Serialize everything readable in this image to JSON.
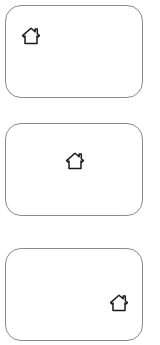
{
  "canvas": {
    "width": 160,
    "height": 345,
    "background_color": "#ffffff"
  },
  "style": {
    "panel_border_color": "#8a8a8a",
    "panel_fill_color": "#ffffff",
    "icon_color": "#1a1a1a",
    "panel_corner_radius": 16
  },
  "panels": [
    {
      "id": "panel-1",
      "icon": "home-icon",
      "icon_position": "top-left",
      "label": ""
    },
    {
      "id": "panel-2",
      "icon": "home-icon",
      "icon_position": "center",
      "label": ""
    },
    {
      "id": "panel-3",
      "icon": "home-icon",
      "icon_position": "bottom-right",
      "label": ""
    }
  ]
}
